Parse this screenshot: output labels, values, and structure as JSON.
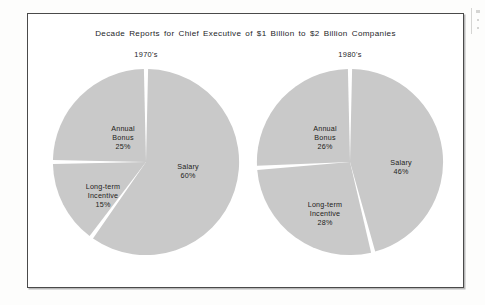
{
  "chart_frame": {
    "title": "Decade Reports for Chief Executive of $1 Billion to $2 Billion Companies"
  },
  "colors": {
    "slice_fill": "#c9c9c9",
    "slice_gap": "#ffffff",
    "frame_border": "#4a4a4a",
    "text": "#24241f",
    "page_background": "#fdfdfc"
  },
  "chart_data": [
    {
      "type": "pie",
      "title": "1970's",
      "categories": [
        "Salary",
        "Long-term Incentive",
        "Annual Bonus"
      ],
      "values": [
        60,
        15,
        25
      ],
      "labels": [
        {
          "name": "Salary",
          "percent": "60%"
        },
        {
          "name": "Long-term",
          "name2": "Incentive",
          "percent": "15%"
        },
        {
          "name": "Annual",
          "name2": "Bonus",
          "percent": "25%"
        }
      ],
      "start_angle_deg": 0,
      "direction": "clockwise",
      "legend": "none",
      "grid": false
    },
    {
      "type": "pie",
      "title": "1980's",
      "categories": [
        "Salary",
        "Long-term Incentive",
        "Annual Bonus"
      ],
      "values": [
        46,
        28,
        26
      ],
      "labels": [
        {
          "name": "Salary",
          "percent": "46%"
        },
        {
          "name": "Long-term",
          "name2": "Incentive",
          "percent": "28%"
        },
        {
          "name": "Annual",
          "name2": "Bonus",
          "percent": "26%"
        }
      ],
      "start_angle_deg": 0,
      "direction": "clockwise",
      "legend": "none",
      "grid": false
    }
  ]
}
